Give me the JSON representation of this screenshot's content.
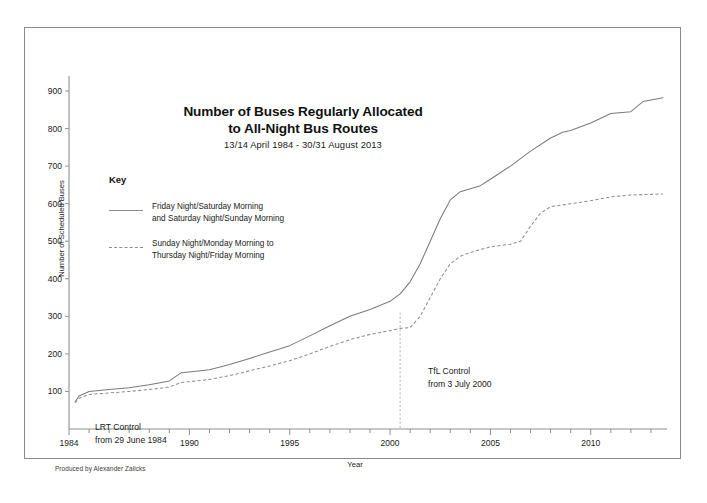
{
  "chart_data": {
    "type": "line",
    "title": "Number of Buses Regularly Allocated to All-Night Bus Routes",
    "title_line1": "Number of Buses Regularly Allocated",
    "title_line2": "to All-Night Bus Routes",
    "subtitle": "13/14 April 1984 - 30/31 August 2013",
    "xlabel": "Year",
    "ylabel": "Number of Scheduled Buses",
    "xlim": [
      1984,
      2013.7
    ],
    "ylim": [
      0,
      940
    ],
    "yticks": [
      100,
      200,
      300,
      400,
      500,
      600,
      700,
      800,
      900
    ],
    "xticks_major": [
      1984,
      1990,
      1995,
      2000,
      2005,
      2010
    ],
    "xticks_minor_step": 1,
    "grid": false,
    "legend_position": "upper-left-inside",
    "legend_title": "Key",
    "series": [
      {
        "name": "Friday Night/Saturday Morning and Saturday Night/Sunday Morning",
        "name_line1": "Friday Night/Saturday Morning",
        "name_line2": "and Saturday Night/Sunday Morning",
        "style": "solid",
        "color": "#7b7b7b",
        "x": [
          1984.3,
          1984.5,
          1985,
          1986,
          1987,
          1988,
          1989,
          1989.6,
          1990,
          1991,
          1992,
          1993,
          1994,
          1995,
          1996,
          1997,
          1998,
          1999,
          2000,
          2000.5,
          2001,
          2001.5,
          2002,
          2002.5,
          2003,
          2003.5,
          2004,
          2004.5,
          2005,
          2006,
          2007,
          2008,
          2008.6,
          2009,
          2010,
          2011,
          2012,
          2012.6,
          2013.6
        ],
        "y": [
          72,
          88,
          100,
          105,
          110,
          118,
          128,
          150,
          152,
          158,
          172,
          188,
          205,
          222,
          248,
          275,
          300,
          318,
          340,
          360,
          392,
          440,
          500,
          560,
          610,
          632,
          640,
          648,
          665,
          700,
          740,
          775,
          790,
          795,
          815,
          840,
          845,
          872,
          882
        ]
      },
      {
        "name": "Sunday Night/Monday Morning to Thursday Night/Friday Morning",
        "name_line1": "Sunday Night/Monday Morning to",
        "name_line2": "Thursday Night/Friday Morning",
        "style": "dashed",
        "color": "#8d8d8d",
        "x": [
          1984.3,
          1984.5,
          1985,
          1986,
          1987,
          1988,
          1989,
          1989.6,
          1990,
          1991,
          1992,
          1993,
          1994,
          1995,
          1996,
          1997,
          1998,
          1999,
          2000,
          2000.5,
          2001,
          2001.5,
          2002,
          2002.5,
          2003,
          2003.5,
          2004,
          2004.5,
          2005,
          2006,
          2006.5,
          2007,
          2007.5,
          2008,
          2009,
          2010,
          2011,
          2012,
          2013.6
        ],
        "y": [
          70,
          82,
          92,
          96,
          100,
          105,
          112,
          124,
          126,
          132,
          142,
          155,
          168,
          182,
          200,
          220,
          238,
          252,
          262,
          268,
          270,
          300,
          350,
          400,
          440,
          460,
          470,
          478,
          485,
          492,
          500,
          540,
          575,
          592,
          600,
          608,
          618,
          623,
          626
        ]
      }
    ],
    "annotations": [
      {
        "id": "lrt",
        "line1": "LRT Control",
        "line2": "from 29 June 1984",
        "marker": "none",
        "x_value": 1984
      },
      {
        "id": "tfl",
        "line1": "TfL Control",
        "line2": "from 3 July 2000",
        "marker": "vertical-dotted-line",
        "x_value": 2000.5
      }
    ]
  },
  "credit": "Produced by Alexander Zalicks"
}
